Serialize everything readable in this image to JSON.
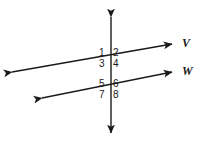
{
  "figure": {
    "background_color": "#ffffff",
    "stroke_color": "#1a1a1a",
    "stroke_width": 1.4,
    "width": 204,
    "height": 147
  },
  "lines": [
    {
      "id": "line-v",
      "name": "V",
      "type": "double-arrow-line",
      "x1": 12,
      "y1": 72,
      "x2": 172,
      "y2": 44
    },
    {
      "id": "line-w",
      "name": "W",
      "type": "double-arrow-line",
      "x1": 42,
      "y1": 98,
      "x2": 172,
      "y2": 72
    },
    {
      "id": "transversal",
      "name": "",
      "type": "double-arrow-line",
      "x1": 111,
      "y1": 17,
      "x2": 111,
      "y2": 133
    }
  ],
  "intersections": [
    {
      "id": "upper",
      "x": 111,
      "y": 54,
      "line": "V"
    },
    {
      "id": "lower",
      "x": 111,
      "y": 86,
      "line": "W"
    }
  ],
  "angle_labels": [
    {
      "id": "1",
      "text": "1",
      "position": "upper-left"
    },
    {
      "id": "2",
      "text": "2",
      "position": "upper-right"
    },
    {
      "id": "3",
      "text": "3",
      "position": "lower-left"
    },
    {
      "id": "4",
      "text": "4",
      "position": "lower-right"
    },
    {
      "id": "5",
      "text": "5",
      "position": "upper-left"
    },
    {
      "id": "6",
      "text": "6",
      "position": "upper-right"
    },
    {
      "id": "7",
      "text": "7",
      "position": "lower-left"
    },
    {
      "id": "8",
      "text": "8",
      "position": "lower-right"
    }
  ],
  "line_labels": [
    {
      "id": "V",
      "text": "V"
    },
    {
      "id": "W",
      "text": "W"
    }
  ]
}
